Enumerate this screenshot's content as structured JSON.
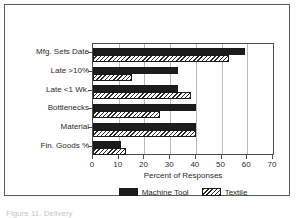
{
  "figure": {
    "caption_sliver": "Figure 11. Delivery"
  },
  "chart_data": {
    "type": "bar",
    "orientation": "horizontal",
    "title": "",
    "xlabel": "Percent of Responses",
    "ylabel": "",
    "xlim": [
      0,
      70
    ],
    "xticks": [
      0,
      10,
      20,
      30,
      40,
      50,
      60,
      70
    ],
    "grid": "vertical",
    "legend_position": "bottom",
    "categories": [
      "Mfg. Sets Date",
      "Late >10%",
      "Late <1 Wk.",
      "Bottlenecks",
      "Material",
      "Fin. Goods %"
    ],
    "series": [
      {
        "name": "Machine Tool",
        "pattern": "solid",
        "color": "#1c1c1c",
        "values": [
          59,
          33,
          33,
          40,
          40,
          11
        ]
      },
      {
        "name": "Textile",
        "pattern": "hatch",
        "color": "#ffffff",
        "values": [
          53,
          15,
          38,
          26,
          40,
          13
        ]
      }
    ]
  }
}
